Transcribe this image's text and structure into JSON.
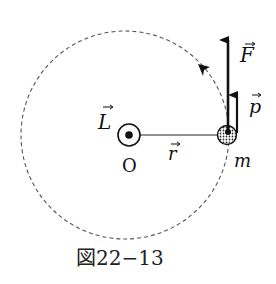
{
  "figure": {
    "caption": "図22−13",
    "labels": {
      "angular_momentum": "L",
      "origin": "O",
      "position": "r",
      "mass": "m",
      "force": "F",
      "momentum": "p"
    },
    "colors": {
      "ink": "#111111",
      "orbit": "#555555",
      "background": "#ffffff"
    }
  }
}
